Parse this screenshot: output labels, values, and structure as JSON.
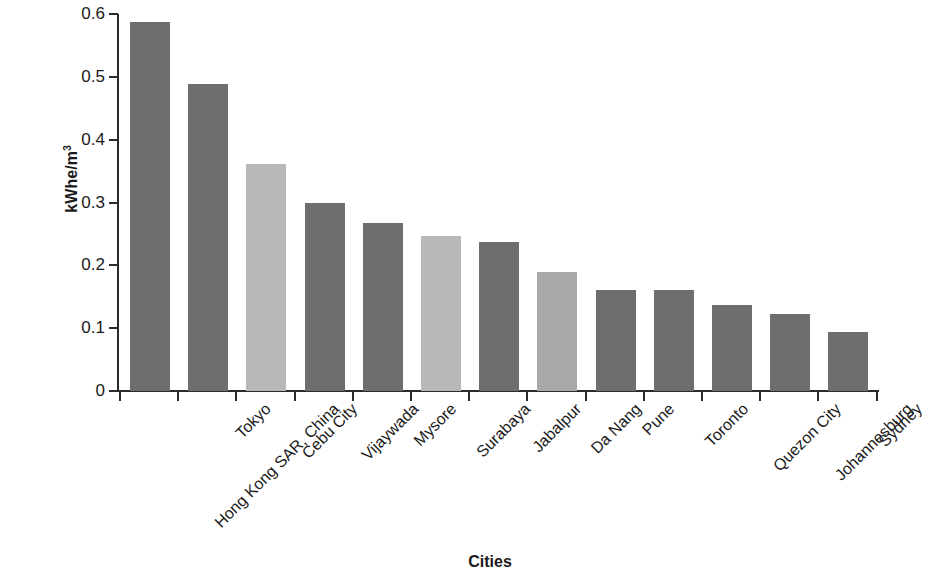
{
  "chart_data": {
    "type": "bar",
    "title": "",
    "xlabel": "Cities",
    "ylabel_text": "kWhe/m",
    "ylabel_sup": "3",
    "ylabel_full": "kWhe/m3",
    "ylim": [
      0,
      0.6
    ],
    "ytick_labels": [
      "0",
      "0.1",
      "0.2",
      "0.3",
      "0.4",
      "0.5",
      "0.6"
    ],
    "ytick_values": [
      0,
      0.1,
      0.2,
      0.3,
      0.4,
      0.5,
      0.6
    ],
    "grid": false,
    "legend": "none",
    "categories": [
      "Hong Kong SAR, China",
      "Tokyo",
      "Cebu City",
      "Vijaywada",
      "Mysore",
      "Surabaya",
      "Jabalpur",
      "Da Nang",
      "Pune",
      "Toronto",
      "Quezon City",
      "Johannesburg",
      "Sydney"
    ],
    "values": [
      0.587,
      0.489,
      0.361,
      0.299,
      0.267,
      0.247,
      0.237,
      0.189,
      0.161,
      0.161,
      0.137,
      0.122,
      0.094
    ],
    "bar_colors": [
      "#6e6e6e",
      "#6e6e6e",
      "#b8b8b8",
      "#6e6e6e",
      "#6e6e6e",
      "#b8b8b8",
      "#6e6e6e",
      "#a8a8a8",
      "#6e6e6e",
      "#6e6e6e",
      "#6e6e6e",
      "#6e6e6e",
      "#6e6e6e"
    ],
    "colors": {
      "dark_gray": "#6e6e6e",
      "light_gray": "#b8b8b8",
      "mid_gray": "#a8a8a8",
      "axis": "#2b2b2b",
      "text": "#1a1a1a",
      "background": "#ffffff"
    }
  }
}
